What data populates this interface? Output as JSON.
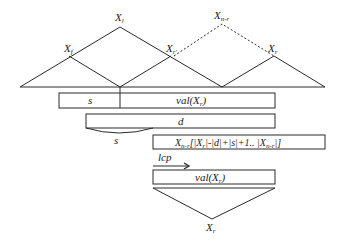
{
  "diagram": {
    "nodes": {
      "top_left": {
        "label": "X",
        "sub": "l"
      },
      "top_right": {
        "label": "X",
        "sub": "n-r"
      },
      "left_child": {
        "label": "X",
        "sub": "f"
      },
      "middle_child": {
        "label": "X",
        "sub": "r'"
      },
      "right_child": {
        "label": "X",
        "sub": "r"
      },
      "bottom": {
        "label": "X",
        "sub": "r"
      }
    },
    "bars": {
      "s_label": "s",
      "val_label": "val(X",
      "val_sub": "r",
      "val_close": ")",
      "d_label": "d",
      "s_brace_label": "s",
      "xnr_label": "X",
      "xnr_sub": "n-r",
      "xnr_expr": "[|X",
      "xnr_expr_sub": "r",
      "xnr_expr_rest": "|-|d|+|s|+1.. |X",
      "xnr_expr_sub2": "n-r",
      "xnr_expr_end": "|]",
      "lcp_label": "lcp",
      "val2_label": "val(X",
      "val2_sub": "r",
      "val2_close": ")"
    }
  }
}
